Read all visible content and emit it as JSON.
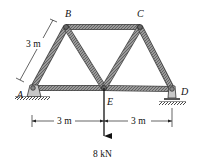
{
  "diagram": {
    "type": "truss",
    "joints": {
      "A": {
        "label": "A",
        "x": 33,
        "y": 88
      },
      "B": {
        "label": "B",
        "x": 66,
        "y": 27
      },
      "C": {
        "label": "C",
        "x": 140,
        "y": 27
      },
      "E": {
        "label": "E",
        "x": 104,
        "y": 88
      },
      "D": {
        "label": "D",
        "x": 172,
        "y": 89
      }
    },
    "members": [
      "AB",
      "BC",
      "CD",
      "AE",
      "ED",
      "BE",
      "CE"
    ],
    "supports": {
      "A": "pin",
      "D": "roller"
    },
    "dimensions": {
      "member_length": "3 m",
      "span_left": "3 m",
      "span_right": "3 m"
    },
    "load": {
      "joint": "E",
      "magnitude": "8 kN",
      "direction": "down"
    }
  }
}
